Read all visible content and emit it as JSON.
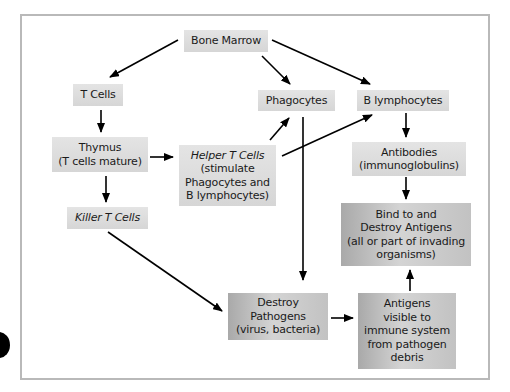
{
  "diagram": {
    "type": "flowchart",
    "title": "",
    "nodes": [
      {
        "id": "bone_marrow",
        "label": "Bone Marrow",
        "style": "light"
      },
      {
        "id": "t_cells",
        "label": "T Cells",
        "style": "light"
      },
      {
        "id": "phagocytes",
        "label": "Phagocytes",
        "style": "light"
      },
      {
        "id": "b_lymphocytes",
        "label": "B lymphocytes",
        "style": "light"
      },
      {
        "id": "thymus",
        "label": "Thymus",
        "sublabel": "(T cells mature)",
        "style": "light"
      },
      {
        "id": "helper_t",
        "label": "Helper T Cells",
        "sublabel_lines": [
          "(stimulate",
          "Phagocytes and",
          "B lymphocytes)"
        ],
        "style": "light",
        "italic_title": true
      },
      {
        "id": "antibodies",
        "label": "Antibodies",
        "sublabel": "(immunoglobulins)",
        "style": "light"
      },
      {
        "id": "killer_t",
        "label": "Killer T Cells",
        "style": "light",
        "italic_title": true
      },
      {
        "id": "bind_destroy",
        "lines": [
          "Bind to and",
          "Destroy Antigens",
          "(all or part of invading",
          "organisms)"
        ],
        "style": "dark"
      },
      {
        "id": "destroy_pathogens",
        "lines": [
          "Destroy",
          "Pathogens",
          "(virus, bacteria)"
        ],
        "style": "dark"
      },
      {
        "id": "antigens_visible",
        "lines": [
          "Antigens",
          "visible to",
          "immune system",
          "from pathogen",
          "debris"
        ],
        "style": "dark"
      }
    ],
    "edges": [
      {
        "from": "bone_marrow",
        "to": "t_cells"
      },
      {
        "from": "bone_marrow",
        "to": "phagocytes"
      },
      {
        "from": "bone_marrow",
        "to": "b_lymphocytes"
      },
      {
        "from": "t_cells",
        "to": "thymus"
      },
      {
        "from": "thymus",
        "to": "helper_t"
      },
      {
        "from": "thymus",
        "to": "killer_t"
      },
      {
        "from": "helper_t",
        "to": "phagocytes"
      },
      {
        "from": "helper_t",
        "to": "b_lymphocytes"
      },
      {
        "from": "b_lymphocytes",
        "to": "antibodies"
      },
      {
        "from": "antibodies",
        "to": "bind_destroy"
      },
      {
        "from": "phagocytes",
        "to": "destroy_pathogens"
      },
      {
        "from": "killer_t",
        "to": "destroy_pathogens"
      },
      {
        "from": "destroy_pathogens",
        "to": "antigens_visible"
      },
      {
        "from": "antigens_visible",
        "to": "bind_destroy"
      }
    ],
    "colors": {
      "light_box": "#dcdcdc",
      "dark_box": "#b8b8b8",
      "arrow": "#000000",
      "frame": "#b9b9b9"
    }
  }
}
